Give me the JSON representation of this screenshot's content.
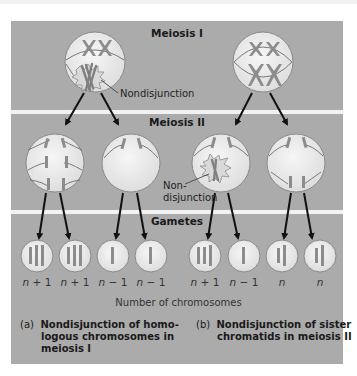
{
  "colors": {
    "panel": "#ababab",
    "separator": "#f2f2f2",
    "cell_fill": "#e9e9e9",
    "cell_stroke": "#8a8a8a",
    "chromosome": "#8c8c8c",
    "spindle": "#6b6b6b",
    "arrow": "#111111"
  },
  "stages": {
    "meiosis1": {
      "title": "Meiosis I"
    },
    "meiosis2": {
      "title": "Meiosis II"
    },
    "gametes": {
      "title": "Gametes"
    }
  },
  "annotations": {
    "nondisjunction_1": "Nondisjunction",
    "nondisjunction_2_line1": "Non-",
    "nondisjunction_2_line2": "disjunction"
  },
  "gametes": [
    {
      "label_n": "n",
      "label_op": " + 1",
      "chromosomes": 3
    },
    {
      "label_n": "n",
      "label_op": " + 1",
      "chromosomes": 3
    },
    {
      "label_n": "n",
      "label_op": " − 1",
      "chromosomes": 1
    },
    {
      "label_n": "n",
      "label_op": " − 1",
      "chromosomes": 1
    },
    {
      "label_n": "n",
      "label_op": " + 1",
      "chromosomes": 3
    },
    {
      "label_n": "n",
      "label_op": " − 1",
      "chromosomes": 1
    },
    {
      "label_n": "n",
      "label_op": "",
      "chromosomes": 2
    },
    {
      "label_n": "n",
      "label_op": "",
      "chromosomes": 2
    }
  ],
  "axis_label": "Number of chromosomes",
  "captions": {
    "a": {
      "tag": "(a)",
      "line1": "Nondisjunction of homo-",
      "line2": "logous chromosomes in",
      "line3": "meiosis I"
    },
    "b": {
      "tag": "(b)",
      "line1": "Nondisjunction of sister",
      "line2": "chromatids in meiosis II"
    }
  }
}
